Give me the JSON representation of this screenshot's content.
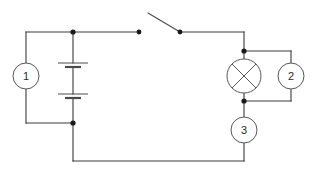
{
  "diagram": {
    "line_color": "#3a3a3a",
    "component_stroke_color": "#585858",
    "node_color": "#1a1a1a",
    "background_color": "#ffffff",
    "label_color": "#2a2a2a"
  },
  "components": {
    "meter_1": {
      "label": "1",
      "icon": "meter-circle-icon",
      "cx": 26,
      "cy": 76,
      "r": 13
    },
    "meter_2": {
      "label": "2",
      "icon": "meter-circle-icon",
      "cx": 291,
      "cy": 76,
      "r": 13
    },
    "meter_3": {
      "label": "3",
      "icon": "meter-circle-icon",
      "cx": 244,
      "cy": 130,
      "r": 13
    },
    "lamp": {
      "label": "",
      "icon": "lamp-crossed-circle-icon",
      "cx": 244,
      "cy": 76,
      "r": 17
    },
    "battery": {
      "label": "",
      "icon": "battery-two-cell-icon",
      "x": 73,
      "cell_1_y": 65,
      "cell_2_y": 96
    },
    "switch": {
      "label": "",
      "icon": "open-switch-icon",
      "state": "open",
      "left_contact_x": 139,
      "pivot_x": 180,
      "y": 32,
      "lever_tip_x": 148,
      "lever_tip_y": 13
    }
  },
  "nodes": [
    {
      "name": "top-left-junction",
      "x": 73,
      "y": 32
    },
    {
      "name": "bottom-left-junction",
      "x": 73,
      "y": 123
    },
    {
      "name": "switch-left-contact",
      "x": 139,
      "y": 32
    },
    {
      "name": "switch-pivot",
      "x": 180,
      "y": 32
    },
    {
      "name": "lamp-top-junction",
      "x": 244,
      "y": 51
    },
    {
      "name": "lamp-bottom-junction",
      "x": 244,
      "y": 101
    }
  ],
  "geometry": {
    "top_wire_y": 32,
    "bottom_wire_y": 161,
    "left_wire_x": 26,
    "battery_branch_x": 73,
    "right_wire_x": 244,
    "meter2_branch_x": 291,
    "left_branch_bottom_y": 123
  }
}
